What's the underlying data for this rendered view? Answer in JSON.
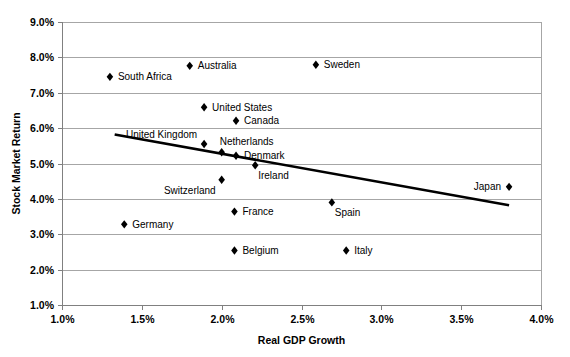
{
  "chart_data": {
    "type": "scatter",
    "title": "",
    "xlabel": "Real GDP Growth",
    "ylabel": "Stock Market Return",
    "xlim": [
      1.0,
      4.0
    ],
    "ylim": [
      1.0,
      9.0
    ],
    "xticks": [
      "1.0%",
      "1.5%",
      "2.0%",
      "2.5%",
      "3.0%",
      "3.5%",
      "4.0%"
    ],
    "xtick_values": [
      1.0,
      1.5,
      2.0,
      2.5,
      3.0,
      3.5,
      4.0
    ],
    "yticks": [
      "1.0%",
      "2.0%",
      "3.0%",
      "4.0%",
      "5.0%",
      "6.0%",
      "7.0%",
      "8.0%",
      "9.0%"
    ],
    "ytick_values": [
      1.0,
      2.0,
      3.0,
      4.0,
      5.0,
      6.0,
      7.0,
      8.0,
      9.0
    ],
    "grid": true,
    "grid_axis": "y",
    "legend": false,
    "legend_position": "none",
    "marker_shape": "diamond",
    "marker_color": "#000000",
    "points": [
      {
        "label": "South Africa",
        "x": 1.3,
        "y": 7.45,
        "label_side": "right"
      },
      {
        "label": "Australia",
        "x": 1.8,
        "y": 7.76,
        "label_side": "right"
      },
      {
        "label": "Sweden",
        "x": 2.59,
        "y": 7.79,
        "label_side": "right"
      },
      {
        "label": "United States",
        "x": 1.89,
        "y": 6.59,
        "label_side": "right"
      },
      {
        "label": "Canada",
        "x": 2.09,
        "y": 6.21,
        "label_side": "right"
      },
      {
        "label": "United Kingdom",
        "x": 1.89,
        "y": 5.55,
        "label_side": "upleft"
      },
      {
        "label": "Netherlands",
        "x": 2.0,
        "y": 5.32,
        "label_side": "upright"
      },
      {
        "label": "Denmark",
        "x": 2.09,
        "y": 5.22,
        "label_side": "right"
      },
      {
        "label": "Ireland",
        "x": 2.21,
        "y": 4.95,
        "label_side": "downright"
      },
      {
        "label": "Switzerland",
        "x": 2.0,
        "y": 4.54,
        "label_side": "downleft"
      },
      {
        "label": "France",
        "x": 2.08,
        "y": 3.64,
        "label_side": "right"
      },
      {
        "label": "Germany",
        "x": 1.39,
        "y": 3.28,
        "label_side": "right"
      },
      {
        "label": "Spain",
        "x": 2.69,
        "y": 3.9,
        "label_side": "downright"
      },
      {
        "label": "Belgium",
        "x": 2.08,
        "y": 2.54,
        "label_side": "right"
      },
      {
        "label": "Italy",
        "x": 2.78,
        "y": 2.54,
        "label_side": "right"
      },
      {
        "label": "Japan",
        "x": 3.8,
        "y": 4.34,
        "label_side": "left"
      }
    ],
    "trendline": {
      "type": "linear",
      "x_start": 1.33,
      "y_start": 5.82,
      "x_end": 3.8,
      "y_end": 3.82
    },
    "colors": {
      "marker": "#000000",
      "trendline": "#000000",
      "gridline": "#a6a6a6",
      "axis": "#808080",
      "text": "#000000",
      "background": "#ffffff"
    }
  }
}
